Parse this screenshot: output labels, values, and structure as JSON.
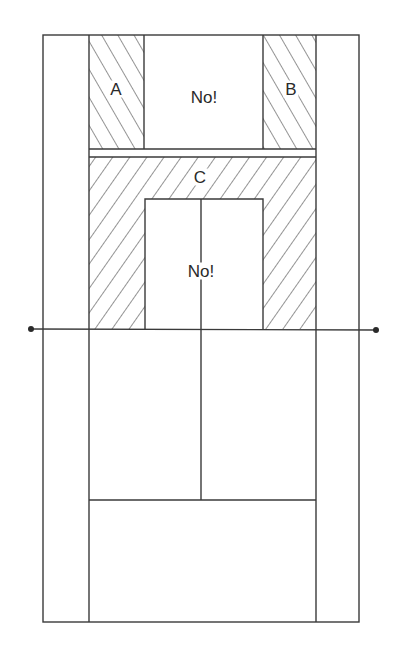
{
  "diagram": {
    "labels": {
      "region_a": "A",
      "region_b": "B",
      "region_c": "C",
      "no_top": "No!",
      "no_middle": "No!"
    },
    "colors": {
      "line": "#3a3a3a",
      "background": "#ffffff"
    }
  }
}
